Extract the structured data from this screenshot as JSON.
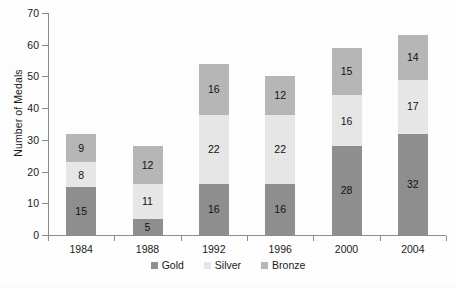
{
  "chart_data": {
    "type": "bar",
    "subtype": "stacked-bar-vertical",
    "title": "",
    "subtitle": "",
    "xlabel": "",
    "ylabel": "Number of Medals",
    "categories": [
      "1984",
      "1988",
      "1992",
      "1996",
      "2000",
      "2004"
    ],
    "series": [
      {
        "name": "Gold",
        "color": "#8e8e8e",
        "values": [
          15,
          5,
          16,
          16,
          28,
          32
        ]
      },
      {
        "name": "Silver",
        "color": "#e6e6e6",
        "values": [
          8,
          11,
          22,
          22,
          16,
          17
        ]
      },
      {
        "name": "Bronze",
        "color": "#b6b6b6",
        "values": [
          9,
          12,
          16,
          12,
          15,
          14
        ]
      }
    ],
    "stack_totals": [
      32,
      28,
      54,
      50,
      59,
      63
    ],
    "ylim": [
      0,
      70
    ],
    "yticks": [
      0,
      10,
      20,
      30,
      40,
      50,
      60,
      70
    ],
    "ytick_labels": [
      "0",
      "10",
      "20",
      "30",
      "40",
      "50",
      "60",
      "70"
    ],
    "grid": false,
    "legend_position": "bottom",
    "legend_entries": [
      "Gold",
      "Silver",
      "Bronze"
    ],
    "data_labels_shown": true,
    "axis_color": "#8c8c8c",
    "background_color": "#fdfdfd"
  },
  "axis": {
    "y_title": "Number of Medals"
  },
  "legend": {
    "items": [
      {
        "label": "Gold"
      },
      {
        "label": "Silver"
      },
      {
        "label": "Bronze"
      }
    ]
  }
}
